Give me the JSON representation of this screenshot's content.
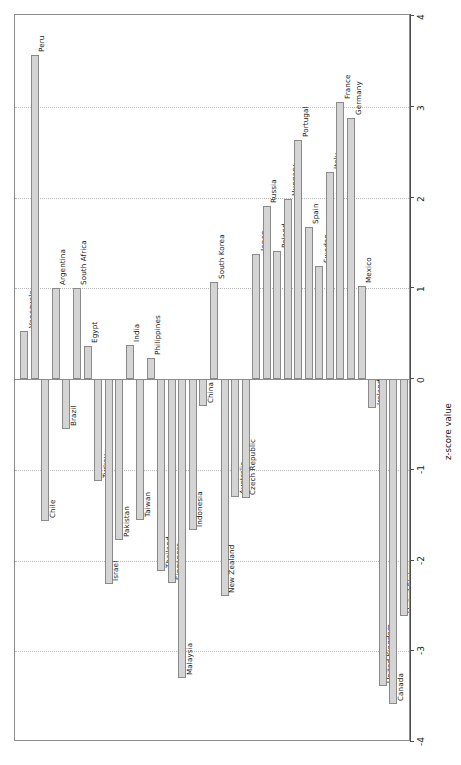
{
  "chart_data": {
    "type": "bar",
    "title": "",
    "subtitle": "",
    "xlabel": "",
    "ylabel": "z-score value",
    "ylim": [
      -4,
      4
    ],
    "grid": true,
    "legend": "none",
    "orientation": "vertical-bars-rotated-labels",
    "tick_labels": [
      "4",
      "3",
      "2",
      "1",
      "0",
      "-1",
      "-2",
      "-3",
      "-4"
    ],
    "tick_values": [
      4,
      3,
      2,
      1,
      0,
      -1,
      -2,
      -3,
      -4
    ],
    "categories": [
      "Venezuela",
      "Peru",
      "Chile",
      "Argentina",
      "Brazil",
      "South Africa",
      "Egypt",
      "Turkey",
      "Israel",
      "Pakistan",
      "India",
      "Taiwan",
      "Philippines",
      "Thailand",
      "Singapore",
      "Malaysia",
      "Indonesia",
      "China",
      "South Korea",
      "New Zealand",
      "Australia",
      "Czech Republic",
      "Japan",
      "Russia",
      "Poland",
      "Hungary",
      "Portugal",
      "Spain",
      "Sweden",
      "Italy",
      "France",
      "Germany",
      "Mexico",
      "Ireland",
      "United Kingdom",
      "Canada",
      "United States"
    ],
    "values": [
      0.53,
      3.57,
      -1.56,
      1.0,
      -0.55,
      1.0,
      0.36,
      -1.12,
      -2.26,
      -1.77,
      0.37,
      -1.55,
      0.23,
      -2.12,
      -2.25,
      -3.3,
      -1.66,
      -0.3,
      1.07,
      -2.39,
      -1.3,
      -1.31,
      1.38,
      1.91,
      1.41,
      1.98,
      2.63,
      1.68,
      1.25,
      2.28,
      3.05,
      2.88,
      1.02,
      -0.32,
      -3.38,
      -3.58,
      -2.61
    ]
  },
  "axis": {
    "title": "z-score value"
  }
}
